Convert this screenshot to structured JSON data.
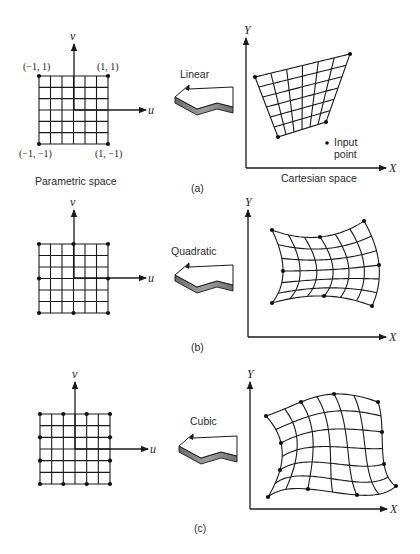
{
  "figure": {
    "panels": [
      {
        "id": "a",
        "caption": "(a)",
        "mapping_label": "Linear",
        "parametric": {
          "title": "Parametric space",
          "axis_u": "u",
          "axis_v": "v",
          "corner_labels": {
            "top_left": "(−1, 1)",
            "top_right": "(1, 1)",
            "bottom_left": "(−1, −1)",
            "bottom_right": "(1, −1)"
          },
          "grid_divisions": 6,
          "control_points_per_side": 2
        },
        "cartesian": {
          "title": "Cartesian space",
          "axis_x": "X",
          "axis_y": "Y",
          "annotation": "Input point",
          "annotation_line1": "Input",
          "annotation_line2": "point",
          "element_order": "linear"
        }
      },
      {
        "id": "b",
        "caption": "(b)",
        "mapping_label": "Quadratic",
        "parametric": {
          "axis_u": "u",
          "axis_v": "v",
          "grid_divisions": 6,
          "control_points_per_side": 3
        },
        "cartesian": {
          "axis_x": "X",
          "axis_y": "Y",
          "element_order": "quadratic"
        }
      },
      {
        "id": "c",
        "caption": "(c)",
        "mapping_label": "Cubic",
        "parametric": {
          "axis_u": "u",
          "axis_v": "v",
          "grid_divisions": 6,
          "control_points_per_side": 4
        },
        "cartesian": {
          "axis_x": "X",
          "axis_y": "Y",
          "element_order": "cubic"
        }
      }
    ],
    "colors": {
      "ink": "#1a1a1a",
      "text": "#2a2a2a",
      "arrow_shadow": "#8a8a8a",
      "background": "#ffffff"
    }
  }
}
